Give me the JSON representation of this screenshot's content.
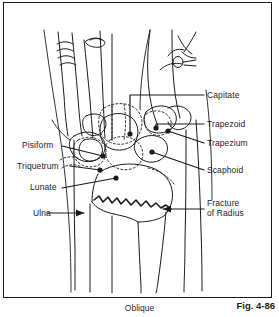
{
  "figure": {
    "caption_title": "Oblique",
    "figure_number": "Fig. 4-86",
    "view_description": "Oblique wrist radiograph line drawing"
  },
  "colors": {
    "ink": "#1a1a1a",
    "background": "#ffffff",
    "text": "#1c1c1c"
  },
  "annotations": {
    "left": [
      {
        "id": "pisiform",
        "label": "Pisiform"
      },
      {
        "id": "triquetrum",
        "label": "Triquetrum"
      },
      {
        "id": "lunate",
        "label": "Lunate"
      },
      {
        "id": "ulna",
        "label": "Ulna"
      }
    ],
    "right": [
      {
        "id": "capitate",
        "label": "Capitate"
      },
      {
        "id": "trapezoid",
        "label": "Trapezoid"
      },
      {
        "id": "trapezium",
        "label": "Trapezium"
      },
      {
        "id": "scaphoid",
        "label": "Scaphoid"
      },
      {
        "id": "fracture-of-radius",
        "label_line1": "Fracture",
        "label_line2": "of Radius"
      }
    ]
  }
}
